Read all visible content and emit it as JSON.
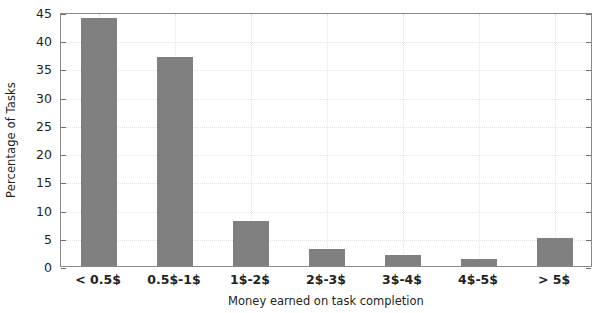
{
  "chart_data": {
    "type": "bar",
    "title": "",
    "xlabel": "Money earned on task completion",
    "ylabel": "Percentage of Tasks",
    "categories": [
      "< 0.5$",
      "0.5$-1$",
      "1$-2$",
      "2$-3$",
      "3$-4$",
      "4$-5$",
      "> 5$"
    ],
    "values": [
      44,
      37,
      8,
      3,
      2,
      1.3,
      5
    ],
    "ylim": [
      0,
      45
    ],
    "xlim": [
      0,
      7
    ],
    "ytick_labels": [
      "0",
      "5",
      "10",
      "15",
      "20",
      "25",
      "30",
      "35",
      "40",
      "45"
    ],
    "ytick_values": [
      0,
      5,
      10,
      15,
      20,
      25,
      30,
      35,
      40,
      45
    ],
    "grid": true,
    "legend": "none",
    "bar_color": "#808080",
    "axis_color": "#8a8a8a",
    "grid_color": "#e2e2e2",
    "text_color": "#231f20"
  }
}
